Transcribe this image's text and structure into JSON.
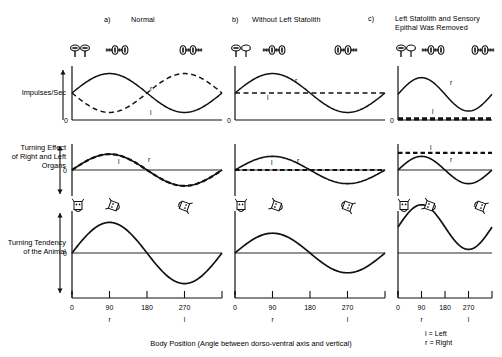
{
  "figure": {
    "caption": "Body Position (Angle between dorso-ventral axis and vertical)",
    "legend": {
      "left": "l = Left",
      "right": "r = Right"
    }
  },
  "panels": [
    {
      "id": "a",
      "marker": "a)",
      "title": "Normal"
    },
    {
      "id": "b",
      "marker": "b)",
      "title": "Without Left Statolith"
    },
    {
      "id": "c",
      "marker": "c)",
      "title_line1": "Left Statolith and Sensory",
      "title_line2": "Epithal Was Removed"
    }
  ],
  "rows": [
    {
      "id": "impulses",
      "label_line1": "Impulses/Sec",
      "label_line2": "",
      "label_line3": "",
      "zero_label": "0"
    },
    {
      "id": "turning-effect",
      "label_line1": "Turning Effect",
      "label_line2": "of Right and Left",
      "label_line3": "Organs",
      "zero_label": "0"
    },
    {
      "id": "turning-tendency",
      "label_line1": "Turning Tendency",
      "label_line2": "of the Animal",
      "label_line3": "",
      "zero_label": "0"
    }
  ],
  "axis": {
    "ticks": [
      "0",
      "90",
      "180",
      "270"
    ],
    "tick_values": [
      0,
      90,
      180,
      270
    ],
    "range": [
      0,
      360
    ],
    "sublabels": [
      {
        "at": 90,
        "text": "r"
      },
      {
        "at": 270,
        "text": "l"
      }
    ]
  },
  "curve_labels": {
    "right": "r",
    "left": "l"
  },
  "chart_data": {
    "type": "line",
    "xlabel": "Body Position (Angle between dorso-ventral axis and vertical)",
    "ylabel": "",
    "xlim": [
      0,
      360
    ],
    "xticks": [
      0,
      90,
      180,
      270
    ],
    "grid": false,
    "legend": [
      "l = Left",
      "r = Right"
    ],
    "panels": [
      {
        "panel": "a",
        "panel_title": "Normal",
        "rows": [
          {
            "row": "Impulses/Sec",
            "ylim": [
              0,
              2
            ],
            "baseline": 0,
            "series": [
              {
                "name": "r",
                "style": "solid",
                "form": "sine",
                "amplitude": 0.72,
                "offset": 1.0,
                "phase_deg": 0,
                "label": "r"
              },
              {
                "name": "l",
                "style": "dashed",
                "form": "sine",
                "amplitude": 0.72,
                "offset": 1.0,
                "phase_deg": 180,
                "label": "l"
              }
            ]
          },
          {
            "row": "Turning Effect of Right and Left Organs",
            "ylim": [
              -1,
              1
            ],
            "baseline": 0,
            "series": [
              {
                "name": "r",
                "style": "solid",
                "form": "sine",
                "amplitude": 0.72,
                "offset": 0,
                "phase_deg": 0,
                "label": "r"
              },
              {
                "name": "l",
                "style": "dashed",
                "form": "sine",
                "amplitude": 0.72,
                "offset": 0,
                "phase_deg": 0,
                "label": "l"
              }
            ]
          },
          {
            "row": "Turning Tendency of the Animal",
            "ylim": [
              -1,
              1
            ],
            "baseline": 0,
            "series": [
              {
                "name": "tendency",
                "style": "solid",
                "form": "sine",
                "amplitude": 0.85,
                "offset": 0,
                "phase_deg": 0
              }
            ]
          }
        ]
      },
      {
        "panel": "b",
        "panel_title": "Without Left Statolith",
        "rows": [
          {
            "row": "Impulses/Sec",
            "ylim": [
              0,
              2
            ],
            "baseline": 0,
            "series": [
              {
                "name": "r",
                "style": "solid",
                "form": "sine",
                "amplitude": 0.72,
                "offset": 1.0,
                "phase_deg": 0,
                "label": "r"
              },
              {
                "name": "l",
                "style": "dashed",
                "form": "flat",
                "amplitude": 0,
                "offset": 1.0,
                "phase_deg": 0,
                "label": "l"
              }
            ]
          },
          {
            "row": "Turning Effect of Right and Left Organs",
            "ylim": [
              -1,
              1
            ],
            "baseline": 0,
            "series": [
              {
                "name": "r",
                "style": "solid",
                "form": "sine",
                "amplitude": 0.62,
                "offset": 0,
                "phase_deg": 0,
                "label": "r"
              },
              {
                "name": "l",
                "style": "dashed",
                "form": "flat",
                "amplitude": 0,
                "offset": 0,
                "phase_deg": 0,
                "label": "l"
              }
            ]
          },
          {
            "row": "Turning Tendency of the Animal",
            "ylim": [
              -1,
              1
            ],
            "baseline": 0,
            "series": [
              {
                "name": "tendency",
                "style": "solid",
                "form": "sine",
                "amplitude": 0.55,
                "offset": 0,
                "phase_deg": 0
              }
            ]
          }
        ]
      },
      {
        "panel": "c",
        "panel_title": "Left Statolith and Sensory Epithal Was Removed",
        "rows": [
          {
            "row": "Impulses/Sec",
            "ylim": [
              0,
              2
            ],
            "baseline": 0,
            "series": [
              {
                "name": "r",
                "style": "solid",
                "form": "sine",
                "amplitude": 0.62,
                "offset": 0.95,
                "phase_deg": 0,
                "label": "r"
              },
              {
                "name": "l",
                "style": "dashed-thick",
                "form": "flat",
                "amplitude": 0,
                "offset": 0.04,
                "phase_deg": 0,
                "label": "l"
              }
            ]
          },
          {
            "row": "Turning Effect of Right and Left Organs",
            "ylim": [
              -1,
              1
            ],
            "baseline": 0,
            "series": [
              {
                "name": "r",
                "style": "solid",
                "form": "sine",
                "amplitude": 0.62,
                "offset": 0,
                "phase_deg": 0,
                "label": "r"
              },
              {
                "name": "l",
                "style": "dashed",
                "form": "flat",
                "amplitude": 0,
                "offset": 0.78,
                "phase_deg": 0,
                "label": "l"
              }
            ]
          },
          {
            "row": "Turning Tendency of the Animal",
            "ylim": [
              -1,
              1
            ],
            "baseline": 0,
            "series": [
              {
                "name": "tendency",
                "style": "solid",
                "form": "sine",
                "amplitude": 0.62,
                "offset": 0.72,
                "phase_deg": 0
              }
            ]
          }
        ]
      }
    ]
  },
  "icons": {
    "statocyst_pair": "statocyst-pair-icon",
    "statocyst_tilted": "statocyst-tilted-icon",
    "animal_upright": "animal-upright-icon",
    "animal_rolled_right": "animal-rolled-right-icon",
    "animal_rolled_left": "animal-rolled-left-icon",
    "arrow_up_down": "arrow-up-down-icon"
  }
}
